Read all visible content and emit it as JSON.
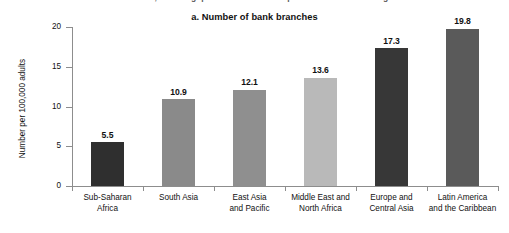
{
  "figure": {
    "cut_off_caption": "the world, but the gaps between rich and poor economies are large",
    "title": "a. Number of bank branches"
  },
  "chart_data": {
    "type": "bar",
    "title": "a. Number of bank branches",
    "xlabel": "",
    "ylabel": "Number per 100,000 adults",
    "ylim": [
      0,
      20
    ],
    "yticks": [
      0,
      5,
      10,
      15,
      20
    ],
    "grid": false,
    "legend": "none",
    "categories": [
      "Sub-Saharan Africa",
      "South Asia",
      "East Asia and Pacific",
      "Middle East and North Africa",
      "Europe and Central Asia",
      "Latin America and the Caribbean"
    ],
    "category_lines": [
      [
        "Sub-Saharan",
        "Africa"
      ],
      [
        "South Asia"
      ],
      [
        "East Asia",
        "and Pacific"
      ],
      [
        "Middle East and",
        "North Africa"
      ],
      [
        "Europe and",
        "Central Asia"
      ],
      [
        "Latin America",
        "and the Caribbean"
      ]
    ],
    "values": [
      5.5,
      10.9,
      12.1,
      13.6,
      17.3,
      19.8
    ],
    "value_labels": [
      "5.5",
      "10.9",
      "12.1",
      "13.6",
      "17.3",
      "19.8"
    ],
    "bar_colors": [
      "#2f2f2f",
      "#8a8a8a",
      "#8f8f8f",
      "#b9b9b9",
      "#373737",
      "#5a5a5a"
    ]
  },
  "colors": {
    "axis": "#8d8d8d",
    "text": "#111111",
    "background": "#ffffff"
  }
}
